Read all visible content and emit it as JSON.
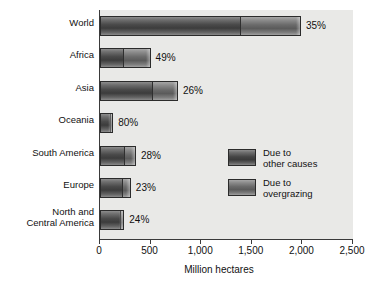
{
  "chart_data": {
    "type": "bar",
    "orientation": "horizontal",
    "stacked": true,
    "title": "",
    "xlabel": "Million hectares",
    "ylabel": "",
    "xlim": [
      0,
      2500
    ],
    "xticks": [
      "0",
      "500",
      "1,000",
      "1,500",
      "2,000",
      "2,500"
    ],
    "xtick_values": [
      0,
      500,
      1000,
      1500,
      2000,
      2500
    ],
    "grid": false,
    "legend_position": "middle-right",
    "categories": [
      "World",
      "Africa",
      "Asia",
      "Oceania",
      "South America",
      "Europe",
      "North and\nCentral America"
    ],
    "series": [
      {
        "name": "Due to overgrazing",
        "values": [
          1390,
          230,
          520,
          105,
          240,
          225,
          200
        ]
      },
      {
        "name": "Due to other causes",
        "values": [
          596,
          270,
          250,
          25,
          115,
          80,
          40
        ]
      }
    ],
    "totals": [
      1986,
      500,
      770,
      130,
      355,
      305,
      240
    ],
    "data_labels": [
      "35%",
      "49%",
      "26%",
      "80%",
      "28%",
      "23%",
      "24%"
    ],
    "annotations": [
      "Percent labels indicate the share of degradation due to overgrazing."
    ]
  },
  "axis": {
    "x_title": "Million hectares"
  },
  "legend": {
    "entries": [
      {
        "label": "Due to\nother causes",
        "swatch": "other",
        "color": "#3a3a3a"
      },
      {
        "label": "Due to\novergrazing",
        "swatch": "overgrazing",
        "color": "#6a6a6a"
      }
    ]
  },
  "colors": {
    "plot_background": "#e9e9e7",
    "axis": "#3a3a3a",
    "overgrazing": "#4a4a4a",
    "other_causes": "#6a6a6a",
    "text": "#111111"
  }
}
